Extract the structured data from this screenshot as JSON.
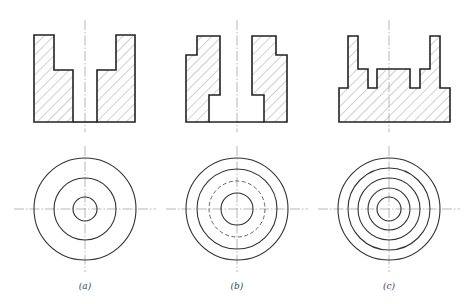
{
  "figure": {
    "title": "",
    "panels": [
      {
        "id": "a",
        "label": "(a)",
        "center_x": 85,
        "section_outline_left": "34,35 54,35 54,70 73,70 73,122 34,122",
        "section_outline_right": "116,35 135,35 135,122 97,122 97,70 116,70",
        "bottom_line": [
          73,
          122,
          97,
          122
        ],
        "circles": [
          {
            "r": 51,
            "style": "solid"
          },
          {
            "r": 31,
            "style": "solid"
          },
          {
            "r": 12,
            "style": "solid"
          }
        ]
      },
      {
        "id": "b",
        "label": "(b)",
        "center_x": 237,
        "section_outline_left": "197,36 220,36 220,95 209,95 209,122 186,122 186,55 197,55",
        "section_outline_right": "252,36 276,36 276,55 287,55 287,122 264,122 264,95 252,95",
        "bottom_line": [
          209,
          122,
          264,
          122
        ],
        "circles": [
          {
            "r": 51,
            "style": "solid"
          },
          {
            "r": 40,
            "style": "solid"
          },
          {
            "r": 28,
            "style": "dashed"
          },
          {
            "r": 16,
            "style": "solid"
          }
        ]
      },
      {
        "id": "c",
        "label": "(c)",
        "center_x": 389,
        "section_outline": "339,88 348,88 348,36 358,36 358,69 368,69 368,88 377,88 377,69 410,69 410,88 420,88 420,69 430,69 430,36 440,36 440,88 450,88 450,122 339,122",
        "circles": [
          {
            "r": 51,
            "style": "solid"
          },
          {
            "r": 41,
            "style": "solid"
          },
          {
            "r": 31,
            "style": "solid"
          },
          {
            "r": 21,
            "style": "solid"
          },
          {
            "r": 12,
            "style": "solid"
          }
        ]
      }
    ],
    "plan_center_y": 209,
    "label_y": 289
  }
}
